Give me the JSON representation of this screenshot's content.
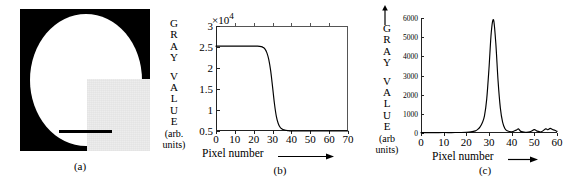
{
  "figure": {
    "panels": [
      {
        "caption": "(a)",
        "type": "image",
        "description": "white disc on black background with light gray square overlay in lower right quadrant and black horizontal scale bar"
      },
      {
        "caption": "(b)",
        "type": "line"
      },
      {
        "caption": "(c)",
        "type": "line"
      }
    ]
  },
  "panel_a": {
    "caption": "(a)",
    "colors": {
      "background": "#000000",
      "disc": "#ffffff",
      "square": "#ededed",
      "scale_bar": "#000000"
    }
  },
  "panel_b": {
    "caption": "(b)",
    "ylabel_letters": [
      "G",
      "R",
      "A",
      "Y",
      "V",
      "A",
      "L",
      "U",
      "E"
    ],
    "ylabel_units_line1": "(arb.",
    "ylabel_units_line2": "units)",
    "multiplier": "×10",
    "multiplier_exponent": "4",
    "xlabel": "Pixel number",
    "yticks": [
      "0.5",
      "1",
      "1.5",
      "2",
      "2.5",
      "3"
    ],
    "xticks": [
      "0",
      "10",
      "20",
      "30",
      "40",
      "50",
      "60",
      "70"
    ]
  },
  "panel_c": {
    "caption": "(c)",
    "ylabel_letters": [
      "G",
      "R",
      "A",
      "Y",
      "V",
      "A",
      "L",
      "U",
      "E"
    ],
    "ylabel_units_line1": "(arb",
    "ylabel_units_line2": "units)",
    "xlabel": "Pixel number",
    "yticks": [
      "0",
      "1000",
      "2000",
      "3000",
      "4000",
      "5000",
      "6000"
    ],
    "xticks": [
      "0",
      "10",
      "20",
      "30",
      "40",
      "50",
      "60"
    ]
  },
  "chart_data": [
    {
      "type": "line",
      "title": "",
      "panel": "(b)",
      "xlabel": "Pixel number",
      "ylabel": "GRAY VALUE (arb. units)",
      "y_multiplier": 10000,
      "xlim": [
        0,
        70
      ],
      "ylim": [
        0.5,
        3
      ],
      "xticks": [
        0,
        10,
        20,
        30,
        40,
        50,
        60,
        70
      ],
      "yticks": [
        0.5,
        1,
        1.5,
        2,
        2.5,
        3
      ],
      "grid": false,
      "legend": null,
      "description": "Edge spread function: sigmoid falling edge near pixel 30",
      "x": [
        0,
        2,
        4,
        6,
        8,
        10,
        12,
        14,
        16,
        18,
        20,
        22,
        24,
        25,
        26,
        27,
        28,
        29,
        30,
        31,
        32,
        33,
        34,
        35,
        36,
        38,
        40,
        45,
        50,
        55,
        60,
        65,
        70
      ],
      "y": [
        2.52,
        2.52,
        2.52,
        2.52,
        2.52,
        2.52,
        2.52,
        2.52,
        2.52,
        2.52,
        2.52,
        2.52,
        2.51,
        2.49,
        2.45,
        2.36,
        2.2,
        1.93,
        1.55,
        1.15,
        0.85,
        0.68,
        0.59,
        0.55,
        0.53,
        0.51,
        0.5,
        0.5,
        0.5,
        0.5,
        0.5,
        0.5,
        0.5
      ]
    },
    {
      "type": "line",
      "title": "",
      "panel": "(c)",
      "xlabel": "Pixel number",
      "ylabel": "GRAY VALUE (arb units)",
      "xlim": [
        0,
        60
      ],
      "ylim": [
        0,
        6400
      ],
      "xticks": [
        0,
        10,
        20,
        30,
        40,
        50,
        60
      ],
      "yticks": [
        0,
        1000,
        2000,
        3000,
        4000,
        5000,
        6000
      ],
      "grid": false,
      "legend": null,
      "description": "Line spread function: narrow peak centered near pixel 32 with small baseline noise",
      "x": [
        0,
        5,
        10,
        15,
        20,
        22,
        24,
        25,
        26,
        27,
        28,
        29,
        30,
        31,
        32,
        33,
        34,
        35,
        36,
        37,
        38,
        40,
        42,
        43,
        44,
        46,
        48,
        50,
        51,
        53,
        55,
        56,
        57,
        58,
        59,
        60
      ],
      "y": [
        20,
        20,
        25,
        25,
        40,
        60,
        120,
        200,
        330,
        560,
        950,
        1900,
        3600,
        5600,
        6300,
        5000,
        2900,
        1400,
        600,
        250,
        120,
        60,
        160,
        230,
        90,
        40,
        60,
        190,
        120,
        60,
        230,
        180,
        260,
        200,
        150,
        90
      ]
    }
  ]
}
